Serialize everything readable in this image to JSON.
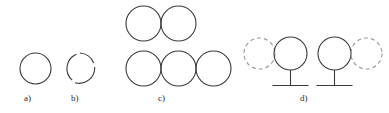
{
  "figure": {
    "width": 389,
    "height": 113,
    "background": "#ffffff"
  },
  "style": {
    "solid_stroke_color": "#3a3a3a",
    "dashed_stroke_color": "#9a9a9a",
    "stem_stroke_color": "#3a3a3a",
    "solid_stroke_width": 1.1,
    "dashed_stroke_width": 1.1,
    "dash_pattern": "4 3",
    "label_color": "#2b2b2b",
    "label_font_size": "9px"
  },
  "panels": [
    {
      "id": "a",
      "label": "a)",
      "label_x": 24,
      "label_y": 94,
      "shapes": [
        {
          "name": "circle-solid",
          "type": "circle",
          "style": "solid",
          "cx": 35.5,
          "cy": 68.5,
          "r": 15.5
        }
      ]
    },
    {
      "id": "b",
      "label": "b)",
      "label_x": 71,
      "label_y": 94,
      "shapes": [
        {
          "name": "circle-solid-gapped",
          "type": "circle",
          "style": "solid-gapped",
          "cx": 80.5,
          "cy": 68.5,
          "r": 15.5
        }
      ]
    },
    {
      "id": "c",
      "label": "c)",
      "label_x": 158,
      "label_y": 94,
      "shapes": [
        {
          "name": "circle-top-left",
          "type": "circle",
          "style": "solid",
          "cx": 143.5,
          "cy": 23.5,
          "r": 17.5
        },
        {
          "name": "circle-top-right",
          "type": "circle",
          "style": "solid",
          "cx": 178.5,
          "cy": 23.5,
          "r": 17.5
        },
        {
          "name": "circle-bottom-left",
          "type": "circle",
          "style": "solid",
          "cx": 143.5,
          "cy": 68.5,
          "r": 17.5
        },
        {
          "name": "circle-bottom-middle",
          "type": "circle",
          "style": "solid",
          "cx": 178.5,
          "cy": 68.5,
          "r": 17.5
        },
        {
          "name": "circle-bottom-right",
          "type": "circle",
          "style": "solid",
          "cx": 213.5,
          "cy": 68.5,
          "r": 17.5
        }
      ]
    },
    {
      "id": "d",
      "label": "d)",
      "label_x": 300,
      "label_y": 94,
      "shapes": [
        {
          "name": "circle-dashed-left",
          "type": "circle",
          "style": "dashed",
          "cx": 259.5,
          "cy": 53.5,
          "r": 15.5
        },
        {
          "name": "circle-solid-left-stemmed",
          "type": "circle",
          "style": "solid",
          "cx": 290.5,
          "cy": 53.5,
          "r": 16.5
        },
        {
          "name": "stem-left",
          "type": "line",
          "x1": 290.5,
          "y1": 70,
          "x2": 290.5,
          "y2": 85
        },
        {
          "name": "base-left",
          "type": "line",
          "x1": 272.5,
          "y1": 85.5,
          "x2": 308.5,
          "y2": 85.5
        },
        {
          "name": "circle-solid-right-stemmed",
          "type": "circle",
          "style": "solid",
          "cx": 334.5,
          "cy": 53.5,
          "r": 16.5
        },
        {
          "name": "circle-dashed-right",
          "type": "circle",
          "style": "dashed",
          "cx": 366.5,
          "cy": 53.5,
          "r": 15.5
        },
        {
          "name": "stem-right",
          "type": "line",
          "x1": 334.5,
          "y1": 70,
          "x2": 334.5,
          "y2": 85
        },
        {
          "name": "base-right",
          "type": "line",
          "x1": 316.5,
          "y1": 85.5,
          "x2": 352.5,
          "y2": 85.5
        }
      ]
    }
  ]
}
